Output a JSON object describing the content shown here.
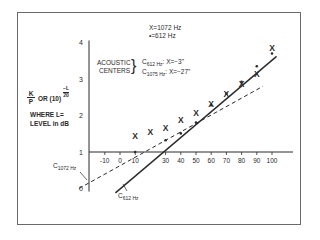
{
  "chart_data": {
    "type": "scatter",
    "title": "",
    "xlabel": "",
    "ylabel": "K/P OR (10)^(-L/20)  WHERE L = LEVEL in dB",
    "xlim": [
      -20,
      105
    ],
    "ylim": [
      0,
      4
    ],
    "x_ticks": [
      -10,
      0,
      10,
      30,
      40,
      50,
      60,
      70,
      80,
      90,
      100
    ],
    "y_ticks": [
      0,
      1,
      2,
      3,
      4
    ],
    "grid": false,
    "legend": {
      "x_marker": "X=1072 Hz",
      "dot_marker": "•=612 Hz"
    },
    "annotations": {
      "acoustic_centers_label": [
        "ACOUSTIC",
        "CENTERS"
      ],
      "c612": "C612 Hz:  X=−3\"",
      "c1075": "C1075 Hz: X=−27\"",
      "line_label_1072": "C1072 Hz",
      "line_label_612": "C612 Hz"
    },
    "series": [
      {
        "name": "1072 Hz",
        "marker": "x",
        "x": [
          10,
          20,
          30,
          40,
          50,
          60,
          70,
          80,
          90,
          100
        ],
        "y": [
          1.43,
          1.55,
          1.67,
          1.89,
          2.08,
          2.32,
          2.59,
          2.87,
          3.14,
          3.84
        ]
      },
      {
        "name": "612 Hz",
        "marker": "dot",
        "x": [
          10,
          30,
          40,
          50,
          60,
          70,
          80,
          90,
          100
        ],
        "y": [
          1.0,
          1.32,
          1.51,
          1.81,
          2.28,
          2.6,
          2.92,
          3.35,
          3.7
        ]
      }
    ],
    "fit_lines": [
      {
        "name": "1072 Hz fit",
        "style": "dashed",
        "from": [
          -27,
          0
        ],
        "to": [
          94,
          2.8
        ]
      },
      {
        "name": "612 Hz fit",
        "style": "solid",
        "from": [
          -3,
          -0.12
        ],
        "to": [
          103,
          3.62
        ]
      }
    ]
  },
  "labels": {
    "legend_x": "X=1072 Hz",
    "legend_dot": "•=612 Hz",
    "acoustic": "ACOUSTIC",
    "centers": "CENTERS",
    "c612_sub": "612 Hz",
    "c612_val": ":  X=−3\"",
    "c1075_sub": "1075 Hz",
    "c1075_val": ": X=−27\"",
    "y_title_k": "K",
    "y_title_p": "P",
    "y_title_or": "OR (10)",
    "y_exp_num": "−L",
    "y_exp_den": "20",
    "where1": "WHERE L=",
    "where2": "LEVEL in dB",
    "c1072_line_sub": "1072 Hz",
    "c612_line_sub": "612 Hz",
    "c_letter": "C"
  }
}
